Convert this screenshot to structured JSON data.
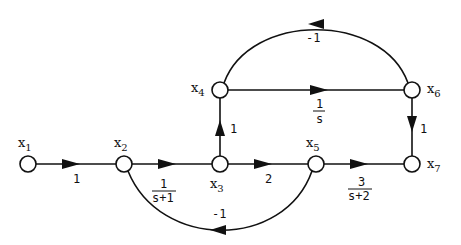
{
  "diagram": {
    "type": "signal-flow-graph",
    "nodes": [
      {
        "id": "x1",
        "label": "x",
        "sub": "1"
      },
      {
        "id": "x2",
        "label": "x",
        "sub": "2"
      },
      {
        "id": "x3",
        "label": "x",
        "sub": "3"
      },
      {
        "id": "x4",
        "label": "x",
        "sub": "4"
      },
      {
        "id": "x5",
        "label": "x",
        "sub": "5"
      },
      {
        "id": "x6",
        "label": "x",
        "sub": "6"
      },
      {
        "id": "x7",
        "label": "x",
        "sub": "7"
      }
    ],
    "edges": [
      {
        "from": "x1",
        "to": "x2",
        "gain": "1"
      },
      {
        "from": "x2",
        "to": "x3",
        "gain_num": "1",
        "gain_den": "s+1"
      },
      {
        "from": "x3",
        "to": "x5",
        "gain": "2"
      },
      {
        "from": "x5",
        "to": "x7",
        "gain_num": "3",
        "gain_den": "s+2"
      },
      {
        "from": "x3",
        "to": "x4",
        "gain": "1"
      },
      {
        "from": "x4",
        "to": "x6",
        "gain_num": "1",
        "gain_den": "s"
      },
      {
        "from": "x6",
        "to": "x7",
        "gain": "1"
      },
      {
        "from": "x6",
        "to": "x4",
        "gain": "-1"
      },
      {
        "from": "x5",
        "to": "x2",
        "gain": "-1"
      }
    ]
  }
}
